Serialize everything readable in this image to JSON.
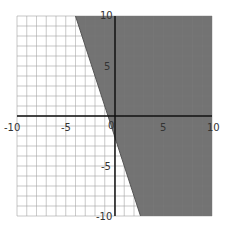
{
  "chart_data": {
    "type": "inequality-graph",
    "title": "",
    "xlabel": "",
    "ylabel": "",
    "xlim": [
      -10,
      10
    ],
    "ylim": [
      -10,
      10
    ],
    "grid": true,
    "grid_step": 1,
    "x_ticks": [
      "-10",
      "-5",
      "0",
      "5",
      "10"
    ],
    "y_ticks": [
      "10",
      "5",
      "-5",
      "-10"
    ],
    "boundary_line": {
      "slope": -3,
      "intercept": -2,
      "points": [
        [
          -4,
          10
        ],
        [
          2.667,
          -10
        ]
      ],
      "style": "solid"
    },
    "inequality": "y >= -3x - 2",
    "shaded_side": "right",
    "colors": {
      "shade": "#6b6b6b",
      "grid": "#c8c8c8",
      "axis": "#111111"
    }
  },
  "labels": {
    "x_neg10": "-10",
    "x_neg5": "-5",
    "origin": "0",
    "x_5": "5",
    "x_10": "10",
    "y_10": "10",
    "y_5": "5",
    "y_neg5": "-5",
    "y_neg10": "-10"
  }
}
